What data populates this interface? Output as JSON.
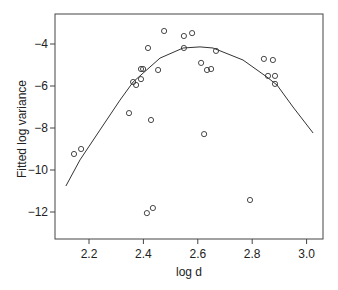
{
  "chart_data": {
    "type": "scatter",
    "title": "",
    "xlabel": "log d",
    "ylabel": "Fitted log variance",
    "xlim": [
      2.08,
      3.07
    ],
    "ylim": [
      -13.3,
      -2.6
    ],
    "xticks": [
      2.2,
      2.4,
      2.6,
      2.8,
      3.0
    ],
    "xtick_labels": [
      "2.2",
      "2.4",
      "2.6",
      "2.8",
      "3.0"
    ],
    "yticks": [
      -4,
      -6,
      -8,
      -10,
      -12
    ],
    "ytick_labels": [
      "−4",
      "−6",
      "−8",
      "−10",
      "−12"
    ],
    "grid": false,
    "legend": null,
    "series": [
      {
        "name": "observed",
        "type": "scatter",
        "marker": "open-circle",
        "points": [
          [
            2.145,
            -9.24
          ],
          [
            2.171,
            -9.0
          ],
          [
            2.347,
            -7.29
          ],
          [
            2.362,
            -5.81
          ],
          [
            2.373,
            -5.95
          ],
          [
            2.391,
            -5.19
          ],
          [
            2.399,
            -5.19
          ],
          [
            2.391,
            -5.67
          ],
          [
            2.413,
            -12.05
          ],
          [
            2.417,
            -4.19
          ],
          [
            2.428,
            -7.62
          ],
          [
            2.435,
            -11.81
          ],
          [
            2.454,
            -5.24
          ],
          [
            2.476,
            -3.38
          ],
          [
            2.549,
            -3.62
          ],
          [
            2.549,
            -4.19
          ],
          [
            2.579,
            -3.48
          ],
          [
            2.612,
            -4.9
          ],
          [
            2.623,
            -8.29
          ],
          [
            2.634,
            -5.24
          ],
          [
            2.649,
            -5.19
          ],
          [
            2.667,
            -4.33
          ],
          [
            2.792,
            -11.43
          ],
          [
            2.843,
            -4.71
          ],
          [
            2.858,
            -5.52
          ],
          [
            2.876,
            -4.76
          ],
          [
            2.884,
            -5.52
          ],
          [
            2.884,
            -5.9
          ]
        ]
      },
      {
        "name": "fitted",
        "type": "line",
        "points": [
          [
            2.115,
            -10.76
          ],
          [
            2.167,
            -9.52
          ],
          [
            2.24,
            -8.1
          ],
          [
            2.314,
            -6.67
          ],
          [
            2.362,
            -5.81
          ],
          [
            2.461,
            -4.67
          ],
          [
            2.546,
            -4.19
          ],
          [
            2.608,
            -4.14
          ],
          [
            2.656,
            -4.19
          ],
          [
            2.766,
            -4.76
          ],
          [
            2.854,
            -5.57
          ],
          [
            2.891,
            -5.95
          ],
          [
            2.95,
            -7.0
          ],
          [
            3.024,
            -8.24
          ]
        ]
      }
    ]
  }
}
